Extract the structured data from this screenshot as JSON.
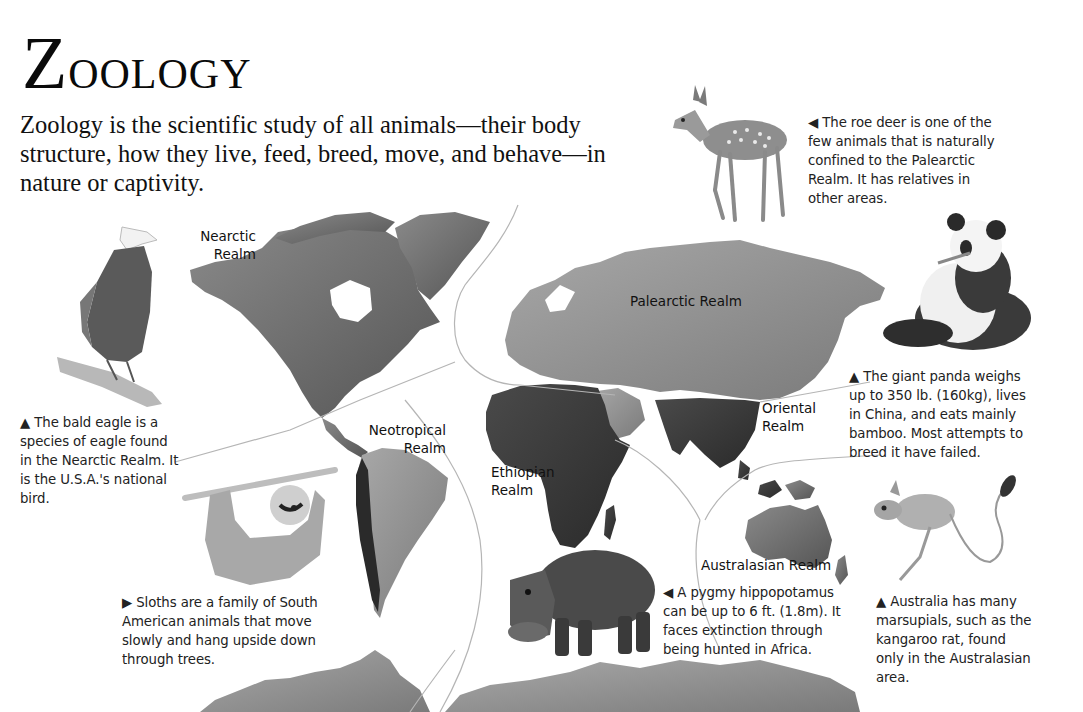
{
  "page": {
    "title": "Zoology",
    "title_first_letter": "Z",
    "title_rest": "oology",
    "intro": "Zoology is the scientific study of all animals—their body structure, how they live, feed, breed, move, and behave—in nature or captivity."
  },
  "map": {
    "realms": [
      {
        "id": "nearctic",
        "line1": "Nearctic",
        "line2": "Realm"
      },
      {
        "id": "palearctic",
        "line1": "Palearctic Realm",
        "line2": ""
      },
      {
        "id": "neotropical",
        "line1": "Neotropical",
        "line2": "Realm"
      },
      {
        "id": "ethiopian",
        "line1": "Ethiopian",
        "line2": "Realm"
      },
      {
        "id": "oriental",
        "line1": "Oriental",
        "line2": "Realm"
      },
      {
        "id": "australasian",
        "line1": "Australasian Realm",
        "line2": ""
      }
    ]
  },
  "captions": {
    "roe_deer": {
      "pointer": "◀",
      "text": "The roe deer is one of the few animals that is naturally confined to the Palearctic Realm. It has relatives in other areas."
    },
    "bald_eagle": {
      "pointer": "▲",
      "text": "The bald eagle is a species of eagle found in the Nearctic Realm. It is the U.S.A.'s national bird."
    },
    "giant_panda": {
      "pointer": "▲",
      "text": "The giant panda weighs up to 350 lb. (160kg), lives in China, and eats mainly bamboo. Most attempts to breed it have failed."
    },
    "sloth": {
      "pointer": "▶",
      "text": "Sloths are a family of South American animals that move slowly and hang upside down through trees."
    },
    "pygmy_hippo": {
      "pointer": "◀",
      "text": "A pygmy hippopotamus can be up to 6 ft. (1.8m). It faces extinction through being hunted in Africa."
    },
    "kangaroo_rat": {
      "pointer": "▲",
      "text": "Australia has many marsupials, such as the kangaroo rat, found only in the Australasian area."
    }
  },
  "colors": {
    "background": "#ffffff",
    "text": "#1a1a1a",
    "land_dark": "#3c3c3c",
    "land_mid": "#6e6e6e",
    "land_light": "#9a9a9a",
    "boundary_line": "#b5b5b5"
  }
}
